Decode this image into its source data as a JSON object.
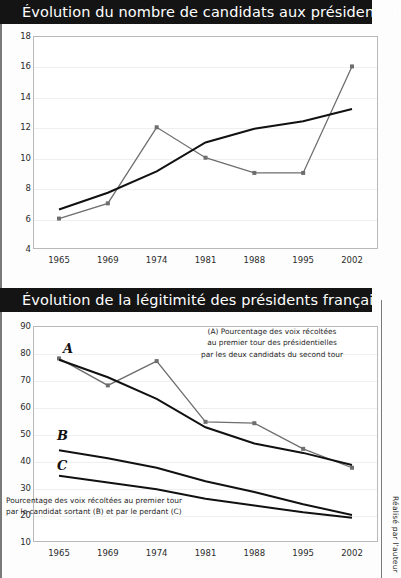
{
  "charts": [
    {
      "title": "Évolution du nombre de candidats aux présidentielles",
      "credit": "",
      "chart_data": {
        "type": "line",
        "title": "Évolution du nombre de candidats aux présidentielles",
        "xlabel": "",
        "ylabel": "",
        "categories": [
          "1965",
          "1969",
          "1974",
          "1981",
          "1988",
          "1995",
          "2002"
        ],
        "ylim": [
          4,
          18
        ],
        "yticks": [
          "4",
          "6",
          "8",
          "10",
          "12",
          "14",
          "16",
          "18"
        ],
        "grid": true,
        "legend": "none",
        "series": [
          {
            "name": "Nombre de candidats",
            "values": [
              6,
              7,
              12,
              10,
              9,
              9,
              16
            ],
            "color": "#6e6e6e",
            "markers": true
          },
          {
            "name": "Tendance linéaire",
            "values": [
              6.6,
              7.7,
              9.1,
              11.0,
              11.9,
              12.4,
              13.2
            ],
            "color": "#111111",
            "markers": false
          }
        ]
      }
    },
    {
      "title": "Évolution de la légitimité des présidents français",
      "credit": "Réalisé par l'auteur",
      "annotation_a": [
        "(A) Pourcentage des voix récoltées",
        "au premier tour des présidentielles",
        "par les deux candidats du second tour"
      ],
      "annotation_bc": [
        "Pourcentage des voix récoltées au premier tour",
        "par le candidat sortant (B) et par le perdant (C)"
      ],
      "series_labels": {
        "a": "A",
        "b": "B",
        "c": "C"
      },
      "chart_data": {
        "type": "line",
        "title": "Évolution de la légitimité des présidents français",
        "xlabel": "",
        "ylabel": "",
        "categories": [
          "1965",
          "1969",
          "1974",
          "1981",
          "1988",
          "1995",
          "2002"
        ],
        "ylim": [
          10,
          90
        ],
        "yticks": [
          "10",
          "20",
          "30",
          "40",
          "50",
          "60",
          "70",
          "80",
          "90"
        ],
        "grid": true,
        "legend": "none",
        "series": [
          {
            "name": "A",
            "values": [
              78,
              68,
              77,
              54.5,
              54,
              44.5,
              37.5
            ],
            "color": "#6e6e6e",
            "markers": true
          },
          {
            "name": "A - tendance",
            "values": [
              77.5,
              71.0,
              63.0,
              52.5,
              46.5,
              43.0,
              38.5
            ],
            "color": "#111111",
            "markers": false
          },
          {
            "name": "B",
            "values": [
              44,
              41.0,
              37.5,
              32.5,
              28.5,
              24.0,
              20.0
            ],
            "color": "#111111",
            "markers": false
          },
          {
            "name": "C",
            "values": [
              34.5,
              32.0,
              29.5,
              26.0,
              23.5,
              21.0,
              19.0
            ],
            "color": "#111111",
            "markers": false
          }
        ]
      }
    }
  ]
}
